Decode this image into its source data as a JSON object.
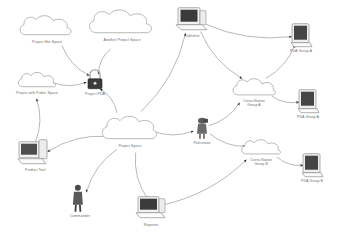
{
  "diagram": {
    "background_color": "#ffffff",
    "line_color": "#9a9a9a",
    "label_color": "#6d6d6d",
    "nodes": [
      {
        "id": "project_space_a",
        "label": "Project Hot Space",
        "type": "cloud",
        "x": 47,
        "y": 29,
        "w": 62,
        "h": 26
      },
      {
        "id": "another_project_space",
        "label": "Another Project Space",
        "type": "cloud",
        "x": 122,
        "y": 25,
        "w": 74,
        "h": 30
      },
      {
        "id": "project_public_space",
        "label": "Project with Public Space",
        "type": "cloud",
        "x": 37,
        "y": 83,
        "w": 44,
        "h": 20
      },
      {
        "id": "project_pda",
        "label": "Project PDA",
        "type": "lock",
        "x": 95,
        "y": 82,
        "w": 22,
        "h": 24
      },
      {
        "id": "publisher",
        "label": "Publisher",
        "type": "desktop",
        "x": 192,
        "y": 22,
        "w": 36,
        "h": 28
      },
      {
        "id": "pda_group_a_top",
        "label": "PDA Group A",
        "type": "monitor",
        "x": 301,
        "y": 38,
        "w": 26,
        "h": 26
      },
      {
        "id": "cross_nation_group_a",
        "label": "Cross-Nation\nGroup A",
        "type": "cloud",
        "x": 254,
        "y": 92,
        "w": 50,
        "h": 22
      },
      {
        "id": "pda_group_a_right",
        "label": "PDA Group A",
        "type": "monitor",
        "x": 308,
        "y": 104,
        "w": 26,
        "h": 26
      },
      {
        "id": "project_space_center",
        "label": "Project Space",
        "type": "cloud",
        "x": 130,
        "y": 131,
        "w": 62,
        "h": 30
      },
      {
        "id": "policeman",
        "label": "Policeman",
        "type": "person",
        "x": 202,
        "y": 131,
        "w": 18,
        "h": 24
      },
      {
        "id": "cross_nation_group_b",
        "label": "Cross-Nation\nGroup B",
        "type": "cloud",
        "x": 261,
        "y": 152,
        "w": 46,
        "h": 20
      },
      {
        "id": "pda_group_b",
        "label": "PDA Group B",
        "type": "monitor",
        "x": 312,
        "y": 168,
        "w": 26,
        "h": 26
      },
      {
        "id": "product_tool",
        "label": "Product Tool",
        "type": "desktop",
        "x": 35,
        "y": 155,
        "w": 36,
        "h": 30
      },
      {
        "id": "commander",
        "label": "Commander",
        "type": "person",
        "x": 80,
        "y": 201,
        "w": 16,
        "h": 30
      },
      {
        "id": "reporter",
        "label": "Reporter",
        "type": "desktop",
        "x": 151,
        "y": 211,
        "w": 34,
        "h": 28
      }
    ],
    "edges": [
      {
        "from": "project_space_a",
        "to": "project_pda",
        "arrow": "end"
      },
      {
        "from": "another_project_space",
        "to": "project_pda",
        "arrow": "end"
      },
      {
        "from": "project_public_space",
        "to": "project_pda",
        "arrow": "end"
      },
      {
        "from": "product_tool",
        "to": "project_public_space",
        "arrow": "end"
      },
      {
        "from": "project_space_center",
        "to": "project_pda",
        "arrow": "end"
      },
      {
        "from": "project_space_center",
        "to": "product_tool",
        "arrow": "end"
      },
      {
        "from": "project_space_center",
        "to": "commander",
        "arrow": "end"
      },
      {
        "from": "project_space_center",
        "to": "reporter",
        "arrow": "end"
      },
      {
        "from": "project_space_center",
        "to": "publisher",
        "arrow": "end"
      },
      {
        "from": "project_space_center",
        "to": "policeman",
        "arrow": "end"
      },
      {
        "from": "publisher",
        "to": "pda_group_a_top",
        "arrow": "end"
      },
      {
        "from": "publisher",
        "to": "cross_nation_group_a",
        "arrow": "end"
      },
      {
        "from": "cross_nation_group_a",
        "to": "pda_group_a_right",
        "arrow": "end"
      },
      {
        "from": "cross_nation_group_a",
        "to": "pda_group_a_top",
        "arrow": "end"
      },
      {
        "from": "policeman",
        "to": "cross_nation_group_b",
        "arrow": "end"
      },
      {
        "from": "cross_nation_group_b",
        "to": "pda_group_b",
        "arrow": "end"
      },
      {
        "from": "reporter",
        "to": "cross_nation_group_b",
        "arrow": "end"
      },
      {
        "from": "policeman",
        "to": "cross_nation_group_a",
        "arrow": "end"
      }
    ]
  }
}
